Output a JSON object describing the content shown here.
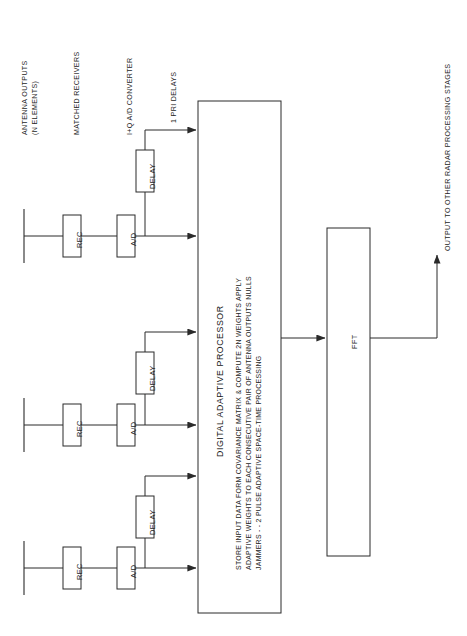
{
  "diagram": {
    "stage_labels": [
      {
        "id": "antenna-outputs",
        "lines": [
          "ANTENNA OUTPUTS",
          "(N ELEMENTS)"
        ]
      },
      {
        "id": "matched-receivers",
        "lines": [
          "MATCHED RECEIVERS"
        ]
      },
      {
        "id": "iq-ad-converter",
        "lines": [
          "I+Q A/D CONVERTER"
        ]
      },
      {
        "id": "one-pri-delays",
        "lines": [
          "1 PRI DELAYS"
        ]
      }
    ],
    "channels": [
      {
        "id": "channel-1",
        "rec": "REC",
        "ad": "A/D",
        "delay": "DELAY"
      },
      {
        "id": "channel-2",
        "rec": "REC",
        "ad": "A/D",
        "delay": "DELAY"
      },
      {
        "id": "channel-3",
        "rec": "REC",
        "ad": "A/D",
        "delay": "DELAY"
      }
    ],
    "processor": {
      "title": "DIGITAL ADAPTIVE PROCESSOR",
      "body_lines": [
        "STORE INPUT DATA FORM COVARIANCE MATRIX & COMPUTE 2N WEIGHTS APPLY",
        "ADAPTIVE WEIGHTS TO EACH CONSECUTIVE PAIR OF ANTENNA OUTPUTS NULLS",
        "JAMMERS - - 2 PULSE ADAPTIVE SPACE-TIME PROCESSING"
      ]
    },
    "fft": {
      "label": "FFT"
    },
    "output": {
      "label": "OUTPUT TO OTHER RADAR PROCESSING STAGES"
    },
    "colors": {
      "stroke": "#2a2a2a",
      "text": "#1d1d1d",
      "background": "#ffffff"
    }
  }
}
